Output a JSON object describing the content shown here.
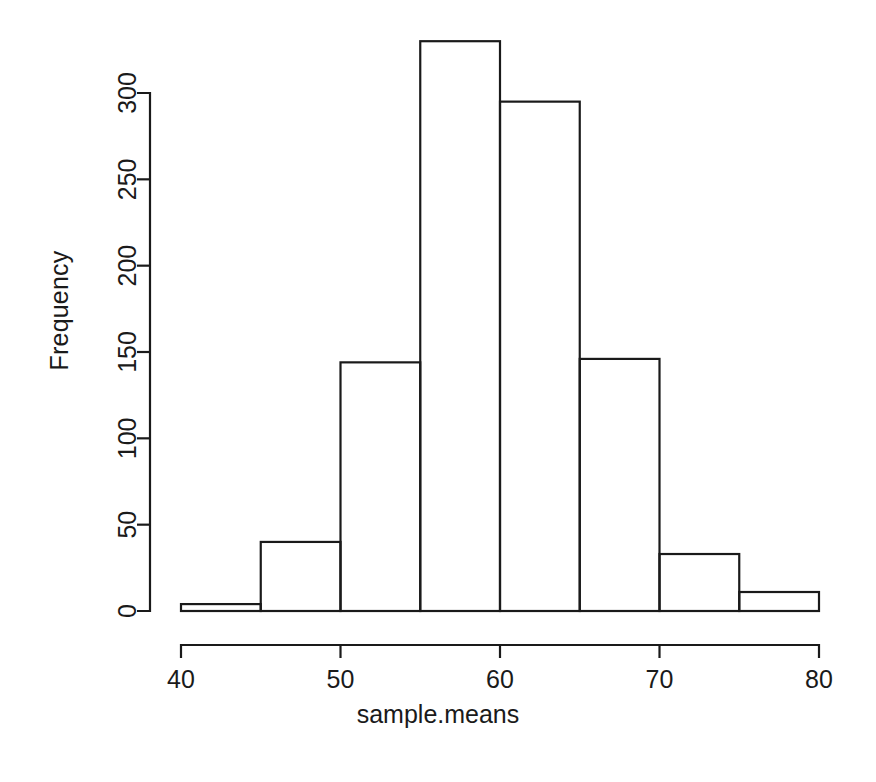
{
  "chart_data": {
    "type": "bar",
    "title": "",
    "subtitle": "",
    "xlabel": "sample.means",
    "ylabel": "Frequency",
    "grid": false,
    "legend": null,
    "legend_position": "none",
    "bin_width": 5,
    "bin_edges": [
      40,
      45,
      50,
      55,
      60,
      65,
      70,
      75,
      80
    ],
    "categories": [
      "40-45",
      "45-50",
      "50-55",
      "55-60",
      "60-65",
      "65-70",
      "70-75",
      "75-80"
    ],
    "values": [
      4,
      40,
      144,
      330,
      295,
      146,
      33,
      11
    ],
    "xlim": [
      40,
      80
    ],
    "ylim": [
      0,
      330
    ],
    "x_ticks": [
      40,
      50,
      60,
      70,
      80
    ],
    "x_tick_labels": [
      "40",
      "50",
      "60",
      "70",
      "80"
    ],
    "y_ticks": [
      0,
      50,
      100,
      150,
      200,
      250,
      300
    ],
    "y_tick_labels": [
      "0",
      "50",
      "100",
      "150",
      "200",
      "250",
      "300"
    ],
    "y_axis_drawn_max": 300,
    "bar_fill_color": "#ffffff",
    "bar_stroke_color": "#1a1a1a",
    "background_color": "#ffffff"
  },
  "labels": {
    "x_axis_title": "sample.means",
    "y_axis_title": "Frequency"
  }
}
